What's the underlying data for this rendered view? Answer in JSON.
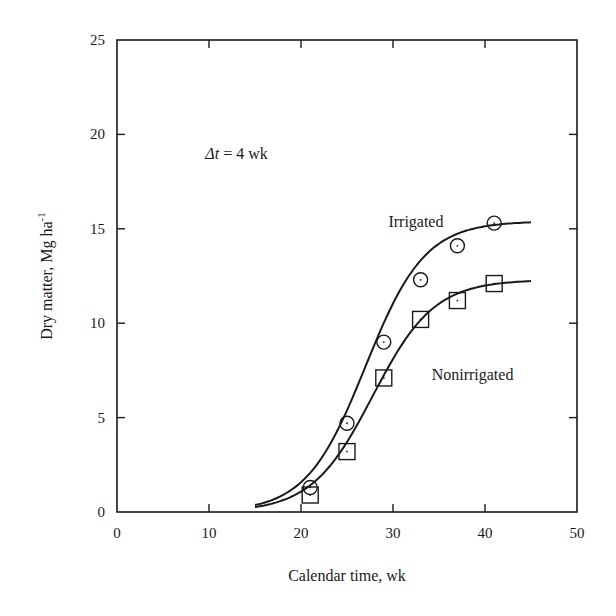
{
  "chart_data": {
    "type": "scatter",
    "title": "",
    "xlabel": "Calendar time, wk",
    "ylabel": "Dry matter, Mg ha",
    "ylabel_superscript": "-1",
    "xlim": [
      0,
      50
    ],
    "ylim": [
      0,
      25
    ],
    "xticks": [
      0,
      10,
      20,
      30,
      40,
      50
    ],
    "yticks": [
      0,
      5,
      10,
      15,
      20,
      25
    ],
    "grid": false,
    "legend": "none (inline labels)",
    "annotation": {
      "prefix": "Δt",
      "text": " = 4 wk"
    },
    "series": [
      {
        "name": "Irrigated",
        "marker": "circle",
        "x": [
          21,
          25,
          29,
          33,
          37,
          41
        ],
        "y": [
          1.3,
          4.7,
          9.0,
          12.3,
          14.1,
          15.3
        ],
        "fit": {
          "model": "logistic",
          "ymax": 15.4,
          "x0": 27.0,
          "k": 0.31,
          "x_start": 15,
          "x_end": 45
        },
        "label_pos": {
          "x": 29.5,
          "y": 15.1
        }
      },
      {
        "name": "Nonirrigated",
        "marker": "square",
        "x": [
          21,
          25,
          29,
          33,
          37,
          41
        ],
        "y": [
          0.9,
          3.2,
          7.1,
          10.2,
          11.2,
          12.1
        ],
        "fit": {
          "model": "logistic",
          "ymax": 12.3,
          "x0": 27.8,
          "k": 0.3,
          "x_start": 15,
          "x_end": 45
        },
        "label_pos": {
          "x": 34.2,
          "y": 7.0
        }
      }
    ]
  },
  "colors": {
    "ink": "#1a1a1a",
    "background": "#ffffff"
  }
}
